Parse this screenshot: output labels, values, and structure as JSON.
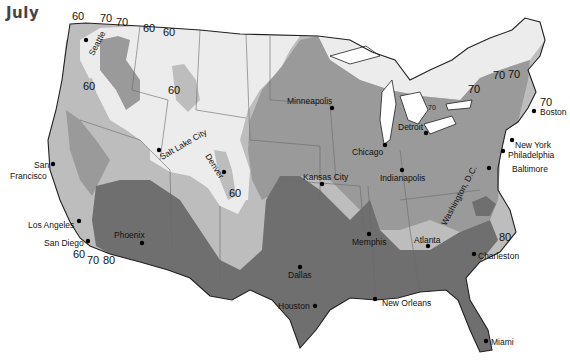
{
  "title": "July",
  "legend_shades": {
    "below_60": "#ececec",
    "60_to_70": "#bdbdbd",
    "70_to_80": "#9a9a9a",
    "above_80": "#6f6f6f"
  },
  "isolines": [
    {
      "value": "60",
      "location": "Seattle north"
    },
    {
      "value": "70",
      "location": "north of Seattle east"
    },
    {
      "value": "70",
      "location": "northern Idaho"
    },
    {
      "value": "60",
      "location": "northern Montana west"
    },
    {
      "value": "60",
      "location": "northern Montana east"
    },
    {
      "value": "60",
      "location": "Oregon interior"
    },
    {
      "value": "60",
      "location": "Montana/Wyoming"
    },
    {
      "value": "60",
      "location": "Colorado south of Denver"
    },
    {
      "value": "60",
      "location": "San Diego"
    },
    {
      "value": "70",
      "location": "San Diego east"
    },
    {
      "value": "80",
      "location": "Arizona border"
    },
    {
      "value": "70",
      "location": "Michigan"
    },
    {
      "value": "70",
      "location": "New York west"
    },
    {
      "value": "70",
      "location": "Vermont"
    },
    {
      "value": "70",
      "location": "New Hampshire"
    },
    {
      "value": "70",
      "location": "Boston"
    },
    {
      "value": "80",
      "location": "North Carolina coast"
    }
  ],
  "cities": [
    {
      "name": "Seattle"
    },
    {
      "name": "San Francisco",
      "line1": "San",
      "line2": "Francisco"
    },
    {
      "name": "Los Angeles"
    },
    {
      "name": "San Diego"
    },
    {
      "name": "Phoenix"
    },
    {
      "name": "Salt Lake City"
    },
    {
      "name": "Denver"
    },
    {
      "name": "Dallas"
    },
    {
      "name": "Houston"
    },
    {
      "name": "Kansas City"
    },
    {
      "name": "Minneapolis"
    },
    {
      "name": "Chicago"
    },
    {
      "name": "Detroit"
    },
    {
      "name": "Indianapolis"
    },
    {
      "name": "Memphis"
    },
    {
      "name": "New Orleans"
    },
    {
      "name": "Atlanta"
    },
    {
      "name": "Washington, D.C."
    },
    {
      "name": "Baltimore"
    },
    {
      "name": "Philadelphia"
    },
    {
      "name": "New York"
    },
    {
      "name": "Boston"
    },
    {
      "name": "Charleston"
    },
    {
      "name": "Miami"
    }
  ]
}
